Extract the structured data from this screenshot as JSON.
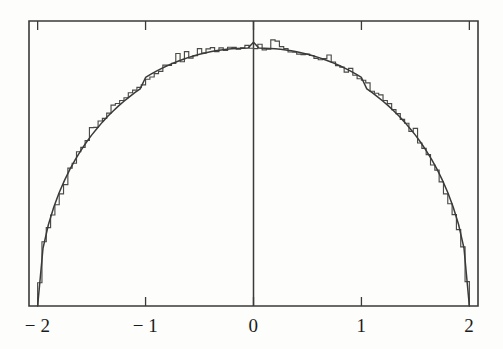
{
  "chart_data": {
    "type": "line",
    "title": "",
    "subtitle": "",
    "xlabel": "",
    "ylabel": "",
    "xlim": [
      -2.08,
      2.08
    ],
    "ylim": [
      0,
      0.3438
    ],
    "grid": false,
    "legend": null,
    "annotations": [
      {
        "name": "vertical-reference-line",
        "x": 0,
        "label": ""
      }
    ],
    "xticks": [
      -2,
      -1,
      0,
      1,
      2
    ],
    "xtick_labels": [
      "−2",
      "−1",
      "0",
      "1",
      "2"
    ],
    "yticks": [],
    "ytick_labels": [],
    "series": [
      {
        "name": "semicircle-density-curve",
        "type": "line",
        "color": "#3a3a38",
        "formula": "y = sqrt(4 - x^2) / (2*pi)",
        "x": [
          -2,
          -1.95,
          -1.9,
          -1.85,
          -1.8,
          -1.75,
          -1.7,
          -1.65,
          -1.6,
          -1.55,
          -1.5,
          -1.45,
          -1.4,
          -1.35,
          -1.3,
          -1.25,
          -1.2,
          -1.15,
          -1.1,
          -1.05,
          -1,
          -0.95,
          -0.9,
          -0.85,
          -0.8,
          -0.75,
          -0.7,
          -0.65,
          -0.6,
          -0.55,
          -0.5,
          -0.45,
          -0.4,
          -0.35,
          -0.3,
          -0.25,
          -0.2,
          -0.15,
          -0.1,
          -0.05,
          0,
          0.05,
          0.1,
          0.15,
          0.2,
          0.25,
          0.3,
          0.35,
          0.4,
          0.45,
          0.5,
          0.55,
          0.6,
          0.65,
          0.7,
          0.75,
          0.8,
          0.85,
          0.9,
          0.95,
          1,
          1.05,
          1.1,
          1.15,
          1.2,
          1.25,
          1.3,
          1.35,
          1.4,
          1.45,
          1.5,
          1.55,
          1.6,
          1.65,
          1.7,
          1.75,
          1.8,
          1.85,
          1.9,
          1.95,
          2
        ],
        "y": [
          0,
          0.0699,
          0.0983,
          0.1195,
          0.1369,
          0.1519,
          0.1651,
          0.1769,
          0.1875,
          0.1972,
          0.2061,
          0.2142,
          0.2218,
          0.2288,
          0.2353,
          0.2414,
          0.247,
          0.2523,
          0.2573,
          0.2619,
          0.2757,
          0.2796,
          0.2833,
          0.2867,
          0.2898,
          0.2927,
          0.2953,
          0.2977,
          0.2999,
          0.3019,
          0.3036,
          0.3052,
          0.3066,
          0.3078,
          0.3088,
          0.3096,
          0.3102,
          0.3107,
          0.311,
          0.3112,
          0.3183,
          0.3112,
          0.311,
          0.3107,
          0.3102,
          0.3096,
          0.3088,
          0.3078,
          0.3066,
          0.3052,
          0.3036,
          0.3019,
          0.2999,
          0.2977,
          0.2953,
          0.2927,
          0.2898,
          0.2867,
          0.2833,
          0.2796,
          0.2757,
          0.2619,
          0.2573,
          0.2523,
          0.247,
          0.2414,
          0.2353,
          0.2288,
          0.2218,
          0.2142,
          0.2061,
          0.1972,
          0.1875,
          0.1769,
          0.1651,
          0.1519,
          0.1369,
          0.1195,
          0.0983,
          0.0699,
          0
        ]
      },
      {
        "name": "empirical-histogram",
        "type": "step",
        "color": "#4a4a46",
        "bin_width": 0.04,
        "bin_centers": [
          -1.98,
          -1.94,
          -1.9,
          -1.86,
          -1.82,
          -1.78,
          -1.74,
          -1.7,
          -1.66,
          -1.62,
          -1.58,
          -1.54,
          -1.5,
          -1.46,
          -1.42,
          -1.38,
          -1.34,
          -1.3,
          -1.26,
          -1.22,
          -1.18,
          -1.14,
          -1.1,
          -1.06,
          -1.02,
          -0.98,
          -0.94,
          -0.9,
          -0.86,
          -0.82,
          -0.78,
          -0.74,
          -0.7,
          -0.66,
          -0.62,
          -0.58,
          -0.54,
          -0.5,
          -0.46,
          -0.42,
          -0.38,
          -0.34,
          -0.3,
          -0.26,
          -0.22,
          -0.18,
          -0.14,
          -0.1,
          -0.06,
          -0.02,
          0.02,
          0.06,
          0.1,
          0.14,
          0.18,
          0.22,
          0.26,
          0.3,
          0.34,
          0.38,
          0.42,
          0.46,
          0.5,
          0.54,
          0.58,
          0.62,
          0.66,
          0.7,
          0.74,
          0.78,
          0.82,
          0.86,
          0.9,
          0.94,
          0.98,
          1.02,
          1.06,
          1.1,
          1.14,
          1.18,
          1.22,
          1.26,
          1.3,
          1.34,
          1.38,
          1.42,
          1.46,
          1.5,
          1.54,
          1.58,
          1.62,
          1.66,
          1.7,
          1.74,
          1.78,
          1.82,
          1.86,
          1.9,
          1.94,
          1.98
        ],
        "counts": [
          0.0281,
          0.0775,
          0.0946,
          0.1098,
          0.1222,
          0.1352,
          0.1464,
          0.1663,
          0.1722,
          0.1861,
          0.1913,
          0.1997,
          0.2152,
          0.2154,
          0.2232,
          0.2263,
          0.2326,
          0.2424,
          0.2443,
          0.2479,
          0.2512,
          0.2572,
          0.2605,
          0.2637,
          0.2668,
          0.2735,
          0.2762,
          0.2804,
          0.2831,
          0.2906,
          0.2902,
          0.2926,
          0.3046,
          0.2947,
          0.3068,
          0.2991,
          0.3021,
          0.3104,
          0.3051,
          0.3102,
          0.3116,
          0.3069,
          0.3114,
          0.3082,
          0.3122,
          0.3119,
          0.3099,
          0.3114,
          0.3144,
          0.3109,
          0.3104,
          0.3157,
          0.3089,
          0.3098,
          0.3211,
          0.3196,
          0.3129,
          0.3104,
          0.3064,
          0.3063,
          0.3038,
          0.3033,
          0.3038,
          0.3022,
          0.2988,
          0.2971,
          0.2984,
          0.3028,
          0.2944,
          0.2899,
          0.2881,
          0.2821,
          0.2866,
          0.2784,
          0.2742,
          0.2723,
          0.2692,
          0.2591,
          0.2567,
          0.2546,
          0.2479,
          0.2441,
          0.2369,
          0.2321,
          0.2252,
          0.2204,
          0.2106,
          0.2143,
          0.1966,
          0.1902,
          0.1826,
          0.1701,
          0.1639,
          0.1497,
          0.1353,
          0.1233,
          0.1102,
          0.0921,
          0.0714,
          0.0295
        ]
      }
    ],
    "axes": {
      "frame": "box",
      "tick_direction": "in",
      "ticks_top": true,
      "ticks_bottom": true,
      "ticks_left": false,
      "ticks_right": false
    },
    "style": {
      "background": "#fdfdfb",
      "frame_color": "#3a3a38",
      "curve_color": "#3a3a38",
      "hist_color": "#4a4a46",
      "label_color": "#1b1b1b"
    }
  }
}
